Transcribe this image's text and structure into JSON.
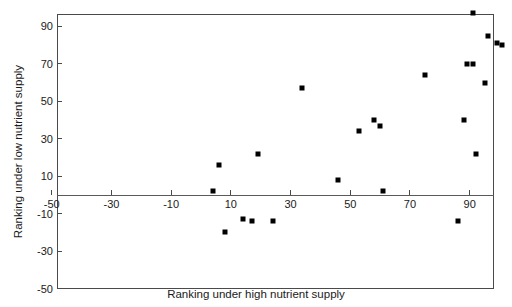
{
  "chart_data": {
    "type": "scatter",
    "title": "",
    "xlabel": "Ranking under high nutrient supply",
    "ylabel": "Ranking under low nutrient supply",
    "xlim": [
      -50,
      105
    ],
    "ylim": [
      -50,
      100
    ],
    "xticks": [
      -50,
      -30,
      -10,
      10,
      30,
      50,
      70,
      90
    ],
    "xticklabels": [
      "-50",
      "-30",
      "-10",
      "10",
      "30",
      "50",
      "70",
      "90"
    ],
    "yticks": [
      90,
      70,
      50,
      30,
      10,
      -10,
      -30,
      -50
    ],
    "yticklabels": [
      "90",
      "70",
      "50",
      "30",
      "10",
      "-10",
      "-30",
      "-50"
    ],
    "grid": false,
    "legend": null,
    "marker_color": "#000000",
    "marker_shape": "square",
    "points": [
      {
        "x": 4,
        "y": 2
      },
      {
        "x": 6,
        "y": 16
      },
      {
        "x": 8,
        "y": -20
      },
      {
        "x": 14,
        "y": -13
      },
      {
        "x": 17,
        "y": -14
      },
      {
        "x": 19,
        "y": 22
      },
      {
        "x": 24,
        "y": -14
      },
      {
        "x": 34,
        "y": 57
      },
      {
        "x": 46,
        "y": 8
      },
      {
        "x": 53,
        "y": 34
      },
      {
        "x": 58,
        "y": 40
      },
      {
        "x": 60,
        "y": 37
      },
      {
        "x": 61,
        "y": 2
      },
      {
        "x": 75,
        "y": 64
      },
      {
        "x": 86,
        "y": -14
      },
      {
        "x": 88,
        "y": 40
      },
      {
        "x": 89,
        "y": 70
      },
      {
        "x": 91,
        "y": 70
      },
      {
        "x": 91,
        "y": 97
      },
      {
        "x": 92,
        "y": 22
      },
      {
        "x": 95,
        "y": 60
      },
      {
        "x": 96,
        "y": 85
      },
      {
        "x": 99,
        "y": 81
      },
      {
        "x": 101,
        "y": 80
      }
    ]
  }
}
